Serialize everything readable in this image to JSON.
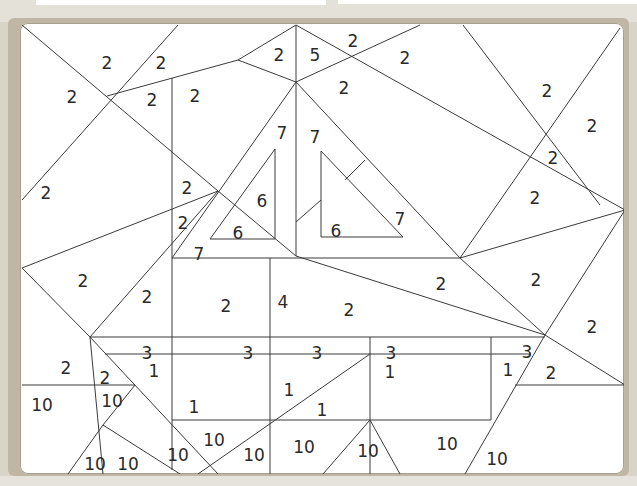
{
  "puzzle": {
    "type": "color-by-number",
    "colors": {
      "frame": "#bfb6a5",
      "board": "#ffffff",
      "line": "#3a3a3a",
      "text": "#2a2a2a"
    },
    "labels": [
      {
        "v": "2",
        "x": 107,
        "y": 63
      },
      {
        "v": "2",
        "x": 161,
        "y": 63
      },
      {
        "v": "2",
        "x": 72,
        "y": 97
      },
      {
        "v": "2",
        "x": 152,
        "y": 100
      },
      {
        "v": "2",
        "x": 195,
        "y": 96
      },
      {
        "v": "2",
        "x": 279,
        "y": 55
      },
      {
        "v": "5",
        "x": 315,
        "y": 55
      },
      {
        "v": "2",
        "x": 353,
        "y": 41
      },
      {
        "v": "2",
        "x": 405,
        "y": 58
      },
      {
        "v": "2",
        "x": 344,
        "y": 88
      },
      {
        "v": "7",
        "x": 282,
        "y": 133
      },
      {
        "v": "7",
        "x": 315,
        "y": 137
      },
      {
        "v": "6",
        "x": 262,
        "y": 201
      },
      {
        "v": "6",
        "x": 238,
        "y": 233
      },
      {
        "v": "6",
        "x": 336,
        "y": 231
      },
      {
        "v": "7",
        "x": 400,
        "y": 219
      },
      {
        "v": "7",
        "x": 199,
        "y": 254
      },
      {
        "v": "2",
        "x": 187,
        "y": 188
      },
      {
        "v": "2",
        "x": 183,
        "y": 223
      },
      {
        "v": "2",
        "x": 46,
        "y": 193
      },
      {
        "v": "2",
        "x": 547,
        "y": 91
      },
      {
        "v": "2",
        "x": 592,
        "y": 126
      },
      {
        "v": "2",
        "x": 553,
        "y": 158
      },
      {
        "v": "2",
        "x": 535,
        "y": 198
      },
      {
        "v": "2",
        "x": 83,
        "y": 281
      },
      {
        "v": "2",
        "x": 147,
        "y": 297
      },
      {
        "v": "2",
        "x": 226,
        "y": 306
      },
      {
        "v": "4",
        "x": 283,
        "y": 302
      },
      {
        "v": "2",
        "x": 349,
        "y": 310
      },
      {
        "v": "2",
        "x": 441,
        "y": 284
      },
      {
        "v": "2",
        "x": 536,
        "y": 280
      },
      {
        "v": "2",
        "x": 592,
        "y": 327
      },
      {
        "v": "3",
        "x": 147,
        "y": 353
      },
      {
        "v": "3",
        "x": 248,
        "y": 353
      },
      {
        "v": "3",
        "x": 317,
        "y": 353
      },
      {
        "v": "3",
        "x": 391,
        "y": 353
      },
      {
        "v": "3",
        "x": 527,
        "y": 352
      },
      {
        "v": "2",
        "x": 66,
        "y": 368
      },
      {
        "v": "2",
        "x": 105,
        "y": 378
      },
      {
        "v": "1",
        "x": 154,
        "y": 371
      },
      {
        "v": "1",
        "x": 390,
        "y": 372
      },
      {
        "v": "1",
        "x": 508,
        "y": 370
      },
      {
        "v": "2",
        "x": 551,
        "y": 373
      },
      {
        "v": "10",
        "x": 42,
        "y": 405
      },
      {
        "v": "10",
        "x": 112,
        "y": 401
      },
      {
        "v": "1",
        "x": 194,
        "y": 407
      },
      {
        "v": "1",
        "x": 289,
        "y": 390
      },
      {
        "v": "1",
        "x": 322,
        "y": 410
      },
      {
        "v": "10",
        "x": 214,
        "y": 440
      },
      {
        "v": "10",
        "x": 178,
        "y": 455
      },
      {
        "v": "10",
        "x": 254,
        "y": 455
      },
      {
        "v": "10",
        "x": 304,
        "y": 447
      },
      {
        "v": "10",
        "x": 368,
        "y": 451
      },
      {
        "v": "10",
        "x": 447,
        "y": 444
      },
      {
        "v": "10",
        "x": 497,
        "y": 459
      },
      {
        "v": "10",
        "x": 95,
        "y": 464
      },
      {
        "v": "10",
        "x": 128,
        "y": 464
      }
    ]
  }
}
